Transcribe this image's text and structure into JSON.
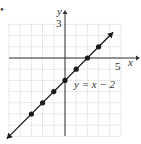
{
  "marker": "•",
  "chart_data": {
    "type": "line",
    "title": "",
    "equation_label": "y = x − 2",
    "xlabel": "x",
    "ylabel": "y",
    "x_tick_label": "5",
    "y_tick_label": "3",
    "xlim": [
      -5,
      5
    ],
    "ylim": [
      -7,
      3
    ],
    "grid": true,
    "series": [
      {
        "name": "y = x − 2",
        "x": [
          -3,
          -2,
          -1,
          0,
          1,
          2,
          3
        ],
        "y": [
          -5,
          -4,
          -3,
          -2,
          -1,
          0,
          1
        ]
      }
    ],
    "line_extends_with_arrows": true,
    "colors": {
      "line": "#1a1a1a",
      "grid": "#b0b0b0",
      "axis": "#333333"
    }
  }
}
